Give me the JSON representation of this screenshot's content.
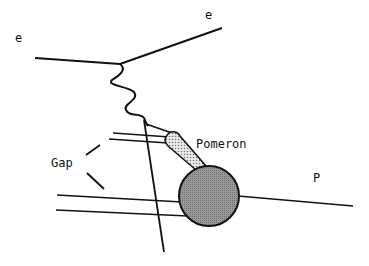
{
  "diagram": {
    "type": "feynman-diagram",
    "labels": {
      "electron_in": "e",
      "electron_out": "e",
      "pomeron": "Pomeron",
      "gap": "Gap",
      "proton": "P"
    },
    "colors": {
      "line": "#111111",
      "proton_blob": "#8a8a8a",
      "pomeron_fill": "#d8d8d8",
      "background": "#ffffff"
    }
  }
}
